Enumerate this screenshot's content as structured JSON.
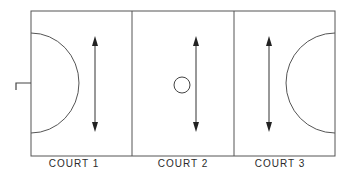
{
  "diagram": {
    "type": "netball-court-thirds",
    "colors": {
      "line": "#555555",
      "arrow": "#222222",
      "background": "#ffffff",
      "label": "#2a2a2a"
    },
    "courts": [
      {
        "id": 1,
        "label": "COURT 1",
        "features": [
          "goal-semicircle-left",
          "goal-post",
          "vertical-double-arrow"
        ]
      },
      {
        "id": 2,
        "label": "COURT 2",
        "features": [
          "centre-circle",
          "vertical-double-arrow"
        ]
      },
      {
        "id": 3,
        "label": "COURT 3",
        "features": [
          "goal-semicircle-right",
          "vertical-double-arrow"
        ]
      }
    ]
  }
}
